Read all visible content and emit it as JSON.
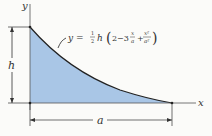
{
  "diagram": {
    "equation": "y = ½h (2−3x/a + x²/a²)",
    "eq_prefix": "y = ",
    "eq_frac": "1/2",
    "eq_h": "h",
    "eq_body_a": "2−3",
    "eq_body_b": "+",
    "x_axis_label": "x",
    "y_axis_label": "y",
    "height_label": "h",
    "width_label": "a",
    "frac1_num": "x",
    "frac1_den": "a",
    "frac2_num": "x²",
    "frac2_den": "a²",
    "fill_color": "#a9c6e6",
    "line_color": "#222222"
  }
}
